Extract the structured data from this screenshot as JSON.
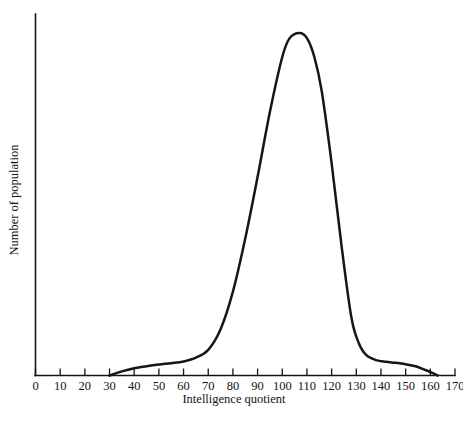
{
  "chart_data": {
    "type": "line",
    "title": "",
    "xlabel": "Intelligence quotient",
    "ylabel": "Number of population",
    "xlim": [
      0,
      170
    ],
    "ylim": [
      0,
      1
    ],
    "grid": false,
    "legend": "none",
    "xticks": [
      "0",
      "10",
      "20",
      "30",
      "40",
      "50",
      "60",
      "70",
      "80",
      "90",
      "100",
      "110",
      "120",
      "130",
      "140",
      "150",
      "160",
      "170"
    ],
    "xtick_values": [
      0,
      10,
      20,
      30,
      40,
      50,
      60,
      70,
      80,
      90,
      100,
      110,
      120,
      130,
      140,
      150,
      160,
      170
    ],
    "yticks": [],
    "ytick_values": [],
    "series": [
      {
        "name": "Distribution of intelligence quotient in the population",
        "x": [
          30,
          35,
          40,
          45,
          50,
          55,
          60,
          65,
          70,
          75,
          80,
          85,
          90,
          95,
          100,
          103,
          107,
          110,
          113,
          116,
          120,
          124,
          128,
          131,
          134,
          138,
          142,
          146,
          150,
          154,
          158,
          161,
          163
        ],
        "values": [
          0.0,
          0.012,
          0.021,
          0.027,
          0.032,
          0.036,
          0.041,
          0.052,
          0.075,
          0.135,
          0.245,
          0.4,
          0.58,
          0.77,
          0.93,
          0.985,
          1.0,
          0.985,
          0.93,
          0.83,
          0.62,
          0.38,
          0.17,
          0.095,
          0.06,
          0.045,
          0.04,
          0.037,
          0.033,
          0.027,
          0.016,
          0.007,
          0.0
        ]
      }
    ],
    "annotations": {
      "peak_x": 105,
      "left_foot_x": 30,
      "right_foot_x": 163
    }
  },
  "axis": {
    "x_title": "Intelligence quotient",
    "y_title": "Number of population"
  },
  "caption": {
    "text": ""
  }
}
